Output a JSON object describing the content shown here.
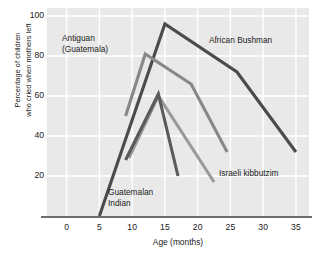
{
  "chart_data": {
    "type": "line",
    "title": "",
    "xlabel": "Age (months)",
    "ylabel": "Percentage of children who cried when mothers left",
    "ylabel_line1": "Percentage of children",
    "ylabel_line2": "who cried when mothers left",
    "xlim": [
      -3,
      37
    ],
    "ylim": [
      0,
      104
    ],
    "xticks": [
      0,
      5,
      10,
      15,
      20,
      25,
      30,
      35
    ],
    "xtick_labels": [
      "0",
      "5",
      "10",
      "15",
      "20",
      "25",
      "30",
      "35"
    ],
    "yticks": [
      20,
      40,
      60,
      80,
      100
    ],
    "ytick_labels": [
      "20",
      "40",
      "60",
      "80",
      "100"
    ],
    "grid": true,
    "grid_color": "#ffffff",
    "plot_background": "#e9e9e9",
    "legend_position": "inline-annotations",
    "series": [
      {
        "name": "African Bushman",
        "color": "#4b4b4b",
        "label_position": "upper-right",
        "x": [
          5,
          15,
          26,
          35
        ],
        "y": [
          0,
          96,
          72,
          32
        ]
      },
      {
        "name": "Antiguan (Guatemala)",
        "color": "#888888",
        "label_position": "upper-left",
        "x": [
          9,
          12,
          19,
          24.5
        ],
        "y": [
          50,
          81,
          66,
          32
        ]
      },
      {
        "name": "Israeli kibbutzim",
        "color": "#9a9a9a",
        "label_position": "lower-right",
        "x": [
          9.5,
          14,
          22.5
        ],
        "y": [
          29,
          60,
          17
        ]
      },
      {
        "name": "Guatemalan Indian",
        "color": "#5a5a5a",
        "label_position": "lower-left",
        "x": [
          9,
          14,
          17
        ],
        "y": [
          28,
          61,
          20
        ]
      }
    ]
  },
  "annotations": {
    "antiguan_line1": "Antiguan",
    "antiguan_line2": "(Guatemala)",
    "bushman": "African Bushman",
    "kibbutzim": "Israeli kibbutzim",
    "guatemalan_line1": "Guatemalan",
    "guatemalan_line2": "Indian"
  },
  "axis": {
    "x_title": "Age (months)",
    "y_title_line1": "Percentage of children",
    "y_title_line2": "who cried when mothers left"
  }
}
